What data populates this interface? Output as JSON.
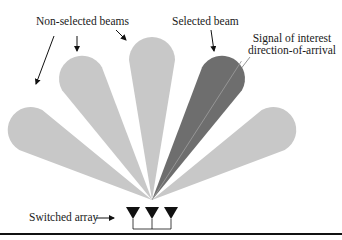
{
  "diagram": {
    "labels": {
      "non_selected": "Non-selected beams",
      "selected": "Selected beam",
      "signal_line1": "Signal of interest",
      "signal_line2": "direction-of-arrival",
      "array": "Switched array"
    },
    "colors": {
      "non_selected_beam": "#c8c8c8",
      "selected_beam": "#6e6e6e",
      "array_element": "#111111",
      "text": "#1a1a1a"
    },
    "beams": [
      {
        "angle_deg": -60,
        "selected": false
      },
      {
        "angle_deg": -30,
        "selected": false
      },
      {
        "angle_deg": 0,
        "selected": false
      },
      {
        "angle_deg": 30,
        "selected": true
      },
      {
        "angle_deg": 60,
        "selected": false
      }
    ],
    "array_elements": 3
  }
}
